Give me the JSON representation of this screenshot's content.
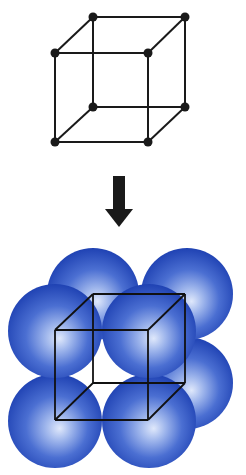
{
  "diagram": {
    "type": "simple-cubic-unit-cell",
    "top_figure": {
      "kind": "lattice-point-cube",
      "vertices": {
        "back_top_left": [
          93,
          17
        ],
        "back_top_right": [
          185,
          17
        ],
        "front_top_left": [
          55,
          53
        ],
        "front_top_right": [
          148,
          53
        ],
        "back_bottom_left": [
          93,
          107
        ],
        "back_bottom_right": [
          185,
          107
        ],
        "front_bottom_left": [
          55,
          142
        ],
        "front_bottom_right": [
          148,
          142
        ]
      },
      "point_count": 8
    },
    "arrow": {
      "direction": "down"
    },
    "bottom_figure": {
      "kind": "space-filling-spheres",
      "sphere_count_visible": 7,
      "sphere_color": "#2b4fbf",
      "sphere_highlight": "#c9d8f5"
    }
  },
  "colors": {
    "line": "#1a1a1a",
    "background": "#ffffff"
  }
}
